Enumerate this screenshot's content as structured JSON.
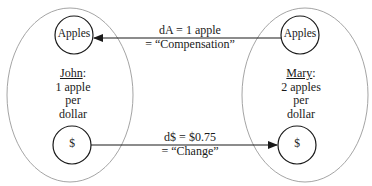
{
  "diagram": {
    "type": "exchange-diagram",
    "colors": {
      "ellipse_stroke": "#9a9a9a",
      "node_stroke": "#1a1a1a",
      "arrow": "#1a1a1a",
      "text": "#1a1a1a"
    },
    "agents": [
      {
        "id": "john",
        "name": "John",
        "name_suffix": ":",
        "lines": [
          "1 apple",
          "per",
          "dollar"
        ],
        "nodes": {
          "top": "Apples",
          "bottom": "$"
        }
      },
      {
        "id": "mary",
        "name": "Mary",
        "name_suffix": ":",
        "lines": [
          "2 apples",
          "per",
          "dollar"
        ],
        "nodes": {
          "top": "Apples",
          "bottom": "$"
        }
      }
    ],
    "edges": [
      {
        "id": "compensation",
        "from": "mary.Apples",
        "to": "john.Apples",
        "line1": "dA = 1 apple",
        "line2": "= “Compensation”"
      },
      {
        "id": "change",
        "from": "john.$",
        "to": "mary.$",
        "line1": "d$ = $0.75",
        "line2": "= “Change”"
      }
    ]
  }
}
